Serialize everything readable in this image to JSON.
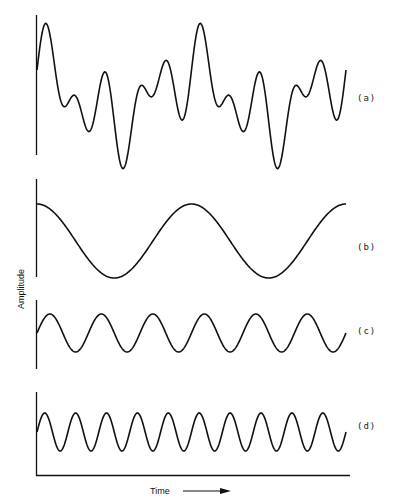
{
  "chart_data": {
    "type": "line",
    "title": "",
    "xlabel": "Time",
    "ylabel": "Amplitude",
    "grid": false,
    "legend": "none",
    "x_range_fundamental_periods": [
      0,
      2
    ],
    "panels": [
      {
        "id": "a",
        "label": "(a)",
        "name": "Composite wave",
        "formula": "cos(θ) + sin(3θ) + sin(5θ)",
        "components": [
          "b",
          "c",
          "d"
        ],
        "center_y": 96,
        "scale_px": 26,
        "key_points": [
          {
            "t": 0,
            "y": 1.0
          },
          {
            "t": 0.07,
            "y": 2.7
          },
          {
            "t": 0.5,
            "y": -1.0
          },
          {
            "t": 0.56,
            "y": -2.8
          },
          {
            "t": 1.0,
            "y": 1.0
          },
          {
            "t": 1.07,
            "y": 2.7
          },
          {
            "t": 1.56,
            "y": -2.8
          },
          {
            "t": 2.0,
            "y": 1.0
          }
        ]
      },
      {
        "id": "b",
        "label": "(b)",
        "name": "Fundamental",
        "frequency_multiple": 1,
        "amplitude": 1,
        "phase": "cos",
        "cycles_shown": 2,
        "center_y": 241,
        "scale_px": 37
      },
      {
        "id": "c",
        "label": "(c)",
        "name": "3rd harmonic",
        "frequency_multiple": 3,
        "amplitude": 1,
        "phase": "sin",
        "cycles_shown": 6,
        "center_y": 333,
        "scale_px": 19
      },
      {
        "id": "d",
        "label": "(d)",
        "name": "5th harmonic",
        "frequency_multiple": 5,
        "amplitude": 1,
        "phase": "sin",
        "cycles_shown": 10,
        "center_y": 432,
        "scale_px": 19
      }
    ]
  },
  "labels": {
    "a": "(a)",
    "b": "(b)",
    "c": "(c)",
    "d": "(d)",
    "ylabel": "Amplitude",
    "xlabel": "Time"
  },
  "colors": {
    "line": "#111111",
    "background": "#ffffff"
  }
}
